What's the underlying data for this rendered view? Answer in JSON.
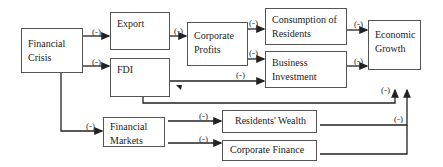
{
  "diagram": {
    "nodes": {
      "financial_crisis": "Financial Crisis",
      "export": "Export",
      "fdi": "FDI",
      "corporate_profits": "Corporate Profits",
      "consumption": "Consumption of Residents",
      "business_investment": "Business Investment",
      "economic_growth": "Economic Growth",
      "financial_markets": "Financial Markets",
      "residents_wealth": "Residents' Wealth",
      "corporate_finance": "Corporate Finance"
    },
    "edge_label": "(-)",
    "edges": [
      {
        "from": "Financial Crisis",
        "to": "Export",
        "label": "(-)"
      },
      {
        "from": "Financial Crisis",
        "to": "FDI",
        "label": "(-)"
      },
      {
        "from": "Financial Crisis",
        "to": "Financial Markets",
        "label": "(-)"
      },
      {
        "from": "Export",
        "to": "Corporate Profits",
        "label": "(-)"
      },
      {
        "from": "Corporate Profits",
        "to": "Consumption of Residents",
        "label": "(-)"
      },
      {
        "from": "Corporate Profits",
        "to": "Business Investment",
        "label": "(-)"
      },
      {
        "from": "FDI",
        "to": "Business Investment",
        "label": "(-)"
      },
      {
        "from": "FDI",
        "to": "Economic Growth",
        "label": "(-)"
      },
      {
        "from": "Consumption of Residents",
        "to": "Economic Growth",
        "label": "(-)"
      },
      {
        "from": "Business Investment",
        "to": "Economic Growth",
        "label": "(-)"
      },
      {
        "from": "Financial Markets",
        "to": "Residents' Wealth",
        "label": "(-)"
      },
      {
        "from": "Financial Markets",
        "to": "Corporate Finance",
        "label": "(-)"
      },
      {
        "from": "Residents' Wealth",
        "to": "Economic Growth",
        "label": "(-)"
      },
      {
        "from": "Corporate Finance",
        "to": "Economic Growth",
        "label": ""
      }
    ],
    "colors": {
      "line": "#222222",
      "border": "#555555",
      "background": "#ffffff"
    }
  }
}
